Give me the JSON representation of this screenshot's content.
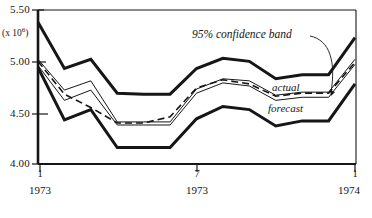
{
  "chart_data": {
    "type": "line",
    "title": "",
    "xlabel": "",
    "ylabel": "",
    "units_label": "(x 10",
    "units_exp": "6",
    "units_close": ")",
    "ylim": [
      4.0,
      5.5
    ],
    "ytick_labels": [
      "5.50",
      "5.00",
      "4.50",
      "4.00"
    ],
    "ytick_values": [
      5.5,
      5.0,
      4.5,
      4.0
    ],
    "xlim": [
      1,
      13
    ],
    "xtick_numbers": [
      "1",
      "7",
      "1"
    ],
    "xtick_years": [
      "1973",
      "1973",
      "1974"
    ],
    "xtick_values": [
      1,
      7,
      13
    ],
    "grid": false,
    "legend_position": "inline-annotations",
    "annotations": [
      {
        "text": "95% confidence band",
        "x": 7.6,
        "y": 5.32
      },
      {
        "text": "actual",
        "x": 11.1,
        "y": 4.82
      },
      {
        "text": "forecast",
        "x": 11.0,
        "y": 4.6
      }
    ],
    "x": [
      1,
      2,
      3,
      4,
      5,
      6,
      7,
      8,
      9,
      10,
      11,
      12,
      13
    ],
    "series": [
      {
        "name": "upper 95% confidence band",
        "style": "thick-solid",
        "values": [
          5.38,
          4.93,
          5.02,
          4.69,
          4.68,
          4.68,
          4.93,
          5.03,
          5.0,
          4.83,
          4.87,
          4.87,
          5.23
        ]
      },
      {
        "name": "upper inner band",
        "style": "thin-solid",
        "values": [
          5.02,
          4.72,
          4.81,
          4.41,
          4.41,
          4.41,
          4.73,
          4.83,
          4.81,
          4.67,
          4.7,
          4.7,
          5.02
        ]
      },
      {
        "name": "actual",
        "style": "dashed",
        "values": [
          5.0,
          4.68,
          4.55,
          4.4,
          4.4,
          4.46,
          4.74,
          4.82,
          4.78,
          4.66,
          4.69,
          4.69,
          4.99
        ]
      },
      {
        "name": "forecast",
        "style": "thin-solid",
        "values": [
          4.96,
          4.62,
          4.72,
          4.38,
          4.38,
          4.38,
          4.69,
          4.79,
          4.76,
          4.62,
          4.65,
          4.65,
          4.97
        ]
      },
      {
        "name": "lower 95% confidence band",
        "style": "thick-solid",
        "values": [
          4.94,
          4.43,
          4.53,
          4.16,
          4.16,
          4.16,
          4.44,
          4.56,
          4.53,
          4.37,
          4.42,
          4.42,
          4.78
        ]
      }
    ]
  },
  "axis": {
    "left_line": true,
    "bottom_line": true,
    "top_line": true,
    "right_line": true
  }
}
